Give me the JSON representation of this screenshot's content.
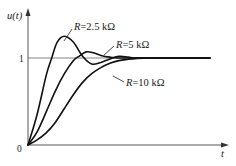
{
  "chart_data": {
    "type": "line",
    "title": "",
    "xlabel": "t",
    "ylabel": "u(t)",
    "origin_label": "0",
    "y_ticks": [
      {
        "value": 1,
        "label": "1"
      }
    ],
    "x_ticks": [],
    "grid": false,
    "legend": "inline annotations with leader lines",
    "xlim": [
      0,
      10
    ],
    "ylim": [
      0,
      1.6
    ],
    "reference_line": {
      "y": 1,
      "style": "horizontal steady-state line"
    },
    "series": [
      {
        "name": "R=2.5 kΩ",
        "label": "R=2.5 kΩ",
        "description": "underdamped: fastest rise, largest overshoot (~1.25), damped oscillation",
        "x": [
          0,
          0.5,
          1.0,
          1.3,
          1.6,
          2.0,
          2.5,
          3.0,
          3.5,
          4.0,
          4.5,
          5.0,
          5.5,
          6.0,
          7.0,
          8.0,
          10.0
        ],
        "y": [
          0,
          0.35,
          0.8,
          1.0,
          1.18,
          1.25,
          1.18,
          1.02,
          0.93,
          0.95,
          0.99,
          1.02,
          1.01,
          1.0,
          1.0,
          1.0,
          1.0
        ]
      },
      {
        "name": "R=5 kΩ",
        "label": "R=5 kΩ",
        "description": "moderately damped: small overshoot (~1.08)",
        "x": [
          0,
          0.5,
          1.0,
          1.5,
          2.0,
          2.5,
          2.8,
          3.2,
          3.6,
          4.0,
          4.5,
          5.0,
          6.0,
          7.0,
          8.0,
          10.0
        ],
        "y": [
          0,
          0.15,
          0.38,
          0.62,
          0.82,
          0.97,
          1.02,
          1.07,
          1.06,
          1.03,
          1.01,
          1.0,
          1.0,
          1.0,
          1.0,
          1.0
        ]
      },
      {
        "name": "R=10 kΩ",
        "label": "R=10 kΩ",
        "description": "overdamped: slow monotonic rise, no overshoot",
        "x": [
          0,
          0.5,
          1.0,
          1.5,
          2.0,
          2.5,
          3.0,
          3.5,
          4.0,
          4.5,
          5.0,
          5.5,
          6.0,
          7.0,
          8.0,
          10.0
        ],
        "y": [
          0,
          0.06,
          0.14,
          0.26,
          0.42,
          0.58,
          0.72,
          0.82,
          0.89,
          0.94,
          0.97,
          0.985,
          0.995,
          1.0,
          1.0,
          1.0
        ]
      }
    ]
  },
  "labels": {
    "y_axis": "u(t)",
    "x_axis": "t",
    "origin": "0",
    "tick_one": "1",
    "r1": "R=2.5 kΩ",
    "r2": "R=5 kΩ",
    "r3": "R=10 kΩ"
  }
}
